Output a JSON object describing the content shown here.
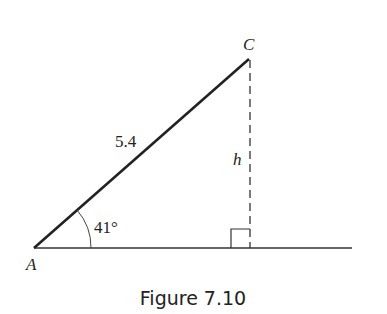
{
  "figure": {
    "caption": "Figure 7.10",
    "vertices": {
      "A": {
        "label": "A",
        "x": 34,
        "y": 248
      },
      "C": {
        "label": "C",
        "x": 249,
        "y": 59
      }
    },
    "hypotenuse_label": "5.4",
    "height_label": "h",
    "angle_label": "41°",
    "right_angle_marker": true
  }
}
